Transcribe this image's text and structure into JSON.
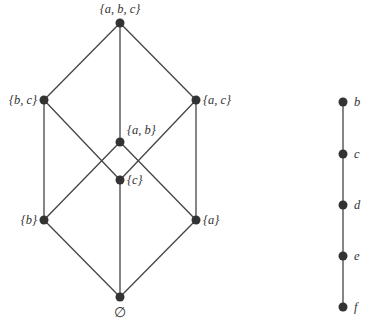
{
  "diagram": {
    "left_lattice": {
      "title": "Power set of {a, b, c}",
      "nodes": [
        {
          "id": "abc",
          "label": "{a, b, c}",
          "x": 120,
          "y": 23,
          "lx": 120,
          "ly": 13,
          "anchor": "middle"
        },
        {
          "id": "bc",
          "label": "{b, c}",
          "x": 44,
          "y": 100,
          "lx": 37,
          "ly": 104,
          "anchor": "end"
        },
        {
          "id": "ac",
          "label": "{a, c}",
          "x": 196,
          "y": 100,
          "lx": 203,
          "ly": 104,
          "anchor": "start"
        },
        {
          "id": "ab",
          "label": "{a, b}",
          "x": 120,
          "y": 142,
          "lx": 127,
          "ly": 134,
          "anchor": "start"
        },
        {
          "id": "c",
          "label": "{c}",
          "x": 120,
          "y": 180,
          "lx": 127,
          "ly": 184,
          "anchor": "start"
        },
        {
          "id": "b",
          "label": "{b}",
          "x": 44,
          "y": 220,
          "lx": 37,
          "ly": 224,
          "anchor": "end"
        },
        {
          "id": "a",
          "label": "{a}",
          "x": 196,
          "y": 220,
          "lx": 203,
          "ly": 224,
          "anchor": "start"
        },
        {
          "id": "empty",
          "label": "∅",
          "x": 120,
          "y": 297,
          "lx": 120,
          "ly": 317,
          "anchor": "middle"
        }
      ],
      "edges": [
        [
          "abc",
          "bc"
        ],
        [
          "abc",
          "ac"
        ],
        [
          "abc",
          "ab"
        ],
        [
          "bc",
          "b"
        ],
        [
          "bc",
          "c"
        ],
        [
          "ac",
          "a"
        ],
        [
          "ac",
          "c"
        ],
        [
          "ab",
          "a"
        ],
        [
          "ab",
          "b"
        ],
        [
          "b",
          "empty"
        ],
        [
          "a",
          "empty"
        ],
        [
          "c",
          "empty"
        ]
      ]
    },
    "right_chain": {
      "title": "Chain",
      "nodes": [
        {
          "id": "b",
          "label": "b",
          "x": 343,
          "y": 102
        },
        {
          "id": "c",
          "label": "c",
          "x": 343,
          "y": 154
        },
        {
          "id": "d",
          "label": "d",
          "x": 343,
          "y": 205
        },
        {
          "id": "e",
          "label": "e",
          "x": 343,
          "y": 256
        },
        {
          "id": "f",
          "label": "f",
          "x": 343,
          "y": 307
        }
      ],
      "edges": [
        [
          "b",
          "c"
        ],
        [
          "c",
          "d"
        ],
        [
          "d",
          "e"
        ],
        [
          "e",
          "f"
        ]
      ]
    }
  }
}
